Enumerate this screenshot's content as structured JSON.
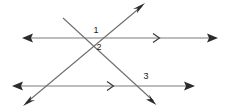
{
  "figure": {
    "background_color": "#ffffff",
    "line_color": "#7d7d7d",
    "arrow_color": "#2b2b2b",
    "label_color": "#1a1a1a"
  },
  "labels": [
    {
      "text": "1",
      "x": 96,
      "y": 33,
      "name": "angle-label-1"
    },
    {
      "text": "2",
      "x": 99,
      "y": 50,
      "name": "angle-label-2"
    },
    {
      "text": "3",
      "x": 146,
      "y": 79,
      "name": "angle-label-3"
    }
  ],
  "lines": [
    {
      "name": "upper-horizontal-line",
      "role": "parallel-line-top",
      "x1": 24,
      "y1": 38,
      "x2": 216,
      "y2": 38,
      "arrow_start": true,
      "arrow_end": true,
      "tick_marks": 1
    },
    {
      "name": "lower-horizontal-line",
      "role": "parallel-line-bottom",
      "x1": 14,
      "y1": 86,
      "x2": 193,
      "y2": 86,
      "arrow_start": true,
      "arrow_end": true,
      "tick_marks": 1
    },
    {
      "name": "transversal-up-right",
      "role": "transversal-a",
      "x1": 25,
      "y1": 104,
      "x2": 143,
      "y2": 5,
      "arrow_start": true,
      "arrow_end": true,
      "tick_marks": 0
    },
    {
      "name": "transversal-down-right",
      "role": "transversal-b",
      "x1": 63,
      "y1": 18,
      "x2": 155,
      "y2": 103,
      "arrow_start": false,
      "arrow_end": true,
      "tick_marks": 0
    }
  ],
  "tick_marks": [
    {
      "name": "direction-tick-upper",
      "x": 158,
      "y": 38
    },
    {
      "name": "direction-tick-lower",
      "x": 112,
      "y": 86
    }
  ],
  "intersections": [
    {
      "name": "vertex-top",
      "x": 97,
      "y": 41
    },
    {
      "name": "vertex-bottom",
      "x": 152,
      "y": 86
    }
  ]
}
